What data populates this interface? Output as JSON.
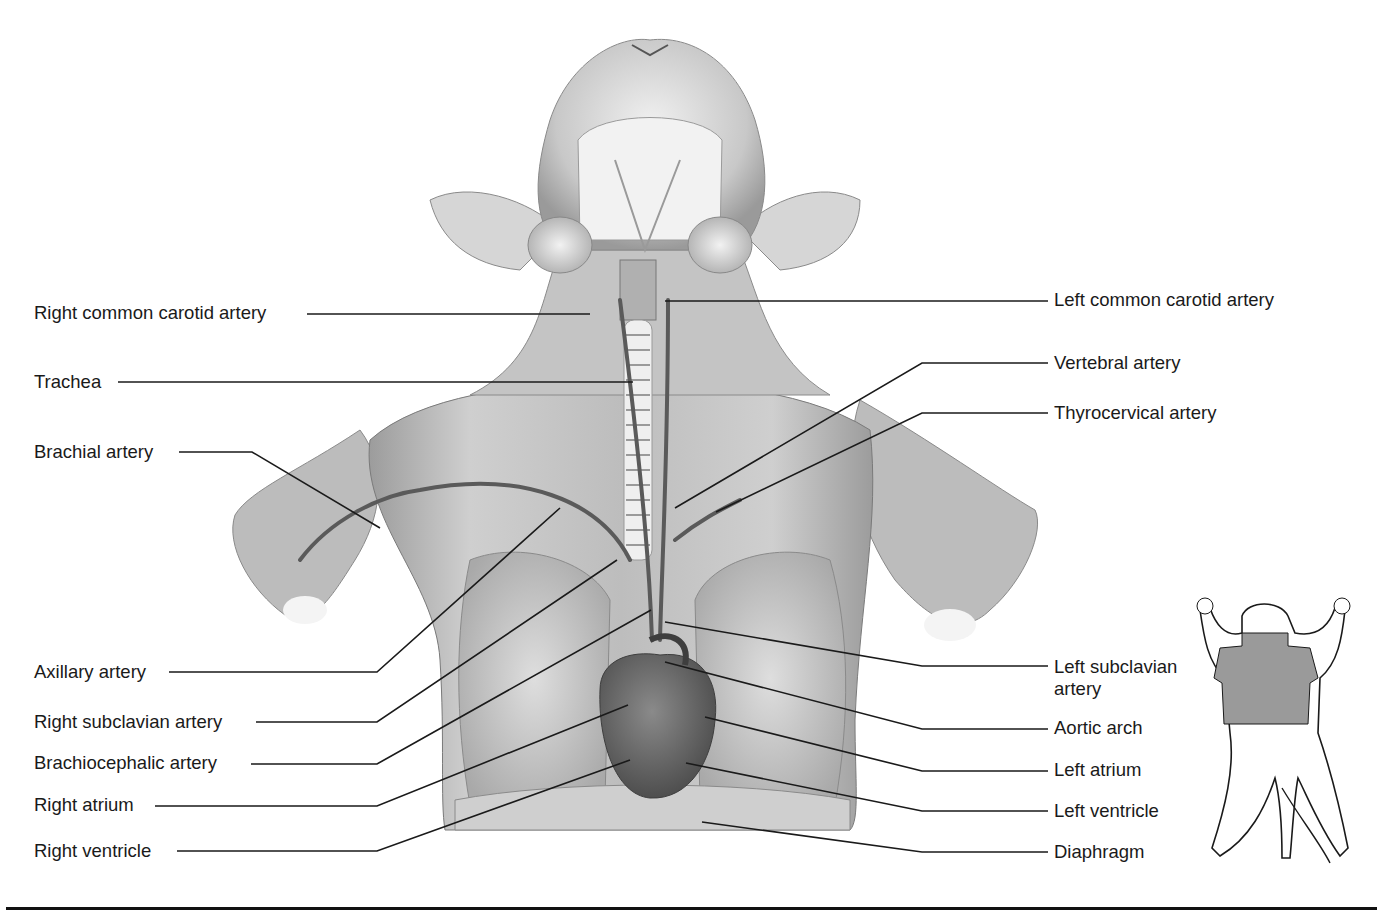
{
  "figure": {
    "colors": {
      "ink": "#1a1a1a",
      "tissue_light": "#d9d9d9",
      "tissue_mid": "#a8a8a8",
      "tissue_dark": "#6e6e6e",
      "inset_shade": "#9a9a9a"
    }
  },
  "labels_left": [
    {
      "id": "right-common-carotid-artery",
      "text": "Right common carotid artery",
      "x": 34,
      "y": 302,
      "line": [
        [
          307,
          314
        ],
        [
          590,
          314
        ]
      ]
    },
    {
      "id": "trachea",
      "text": "Trachea",
      "x": 34,
      "y": 371,
      "line": [
        [
          118,
          382
        ],
        [
          633,
          382
        ]
      ]
    },
    {
      "id": "brachial-artery",
      "text": "Brachial artery",
      "x": 34,
      "y": 441,
      "line": [
        [
          179,
          452
        ],
        [
          252,
          452
        ],
        [
          380,
          528
        ]
      ]
    },
    {
      "id": "axillary-artery",
      "text": "Axillary artery",
      "x": 34,
      "y": 661,
      "line": [
        [
          169,
          672
        ],
        [
          377,
          672
        ],
        [
          560,
          508
        ]
      ]
    },
    {
      "id": "right-subclavian-artery",
      "text": "Right subclavian artery",
      "x": 34,
      "y": 711,
      "line": [
        [
          256,
          722
        ],
        [
          377,
          722
        ],
        [
          617,
          560
        ]
      ]
    },
    {
      "id": "brachiocephalic-artery",
      "text": "Brachiocephalic artery",
      "x": 34,
      "y": 752,
      "line": [
        [
          251,
          764
        ],
        [
          377,
          764
        ],
        [
          651,
          610
        ]
      ]
    },
    {
      "id": "right-atrium",
      "text": "Right atrium",
      "x": 34,
      "y": 794,
      "line": [
        [
          155,
          806
        ],
        [
          377,
          806
        ],
        [
          628,
          705
        ]
      ]
    },
    {
      "id": "right-ventricle",
      "text": "Right ventricle",
      "x": 34,
      "y": 840,
      "line": [
        [
          177,
          851
        ],
        [
          377,
          851
        ],
        [
          630,
          760
        ]
      ]
    }
  ],
  "labels_right": [
    {
      "id": "left-common-carotid-artery",
      "text": "Left common carotid artery",
      "x": 1054,
      "y": 289,
      "line": [
        [
          665,
          301
        ],
        [
          1048,
          301
        ]
      ]
    },
    {
      "id": "vertebral-artery",
      "text": "Vertebral artery",
      "x": 1054,
      "y": 352,
      "line": [
        [
          675,
          508
        ],
        [
          922,
          363
        ],
        [
          1048,
          363
        ]
      ]
    },
    {
      "id": "thyrocervical-artery",
      "text": "Thyrocervical artery",
      "x": 1054,
      "y": 402,
      "line": [
        [
          716,
          512
        ],
        [
          922,
          413
        ],
        [
          1048,
          413
        ]
      ]
    },
    {
      "id": "left-subclavian-artery",
      "text": "Left subclavian artery",
      "x": 1054,
      "y": 656,
      "line": [
        [
          665,
          622
        ],
        [
          922,
          666
        ],
        [
          1048,
          666
        ]
      ]
    },
    {
      "id": "aortic-arch",
      "text": "Aortic arch",
      "x": 1054,
      "y": 717,
      "line": [
        [
          665,
          662
        ],
        [
          922,
          729
        ],
        [
          1048,
          729
        ]
      ]
    },
    {
      "id": "left-atrium",
      "text": "Left atrium",
      "x": 1054,
      "y": 759,
      "line": [
        [
          705,
          717
        ],
        [
          922,
          771
        ],
        [
          1048,
          771
        ]
      ]
    },
    {
      "id": "left-ventricle",
      "text": "Left ventricle",
      "x": 1054,
      "y": 800,
      "line": [
        [
          686,
          763
        ],
        [
          922,
          811
        ],
        [
          1048,
          811
        ]
      ]
    },
    {
      "id": "diaphragm",
      "text": "Diaphragm",
      "x": 1054,
      "y": 841,
      "line": [
        [
          702,
          822
        ],
        [
          922,
          852
        ],
        [
          1048,
          852
        ]
      ]
    }
  ],
  "inset": {
    "description": "Orientation inset: supine cat silhouette with shaded thorax region",
    "x": 1190,
    "y": 588,
    "width": 160,
    "height": 280
  }
}
